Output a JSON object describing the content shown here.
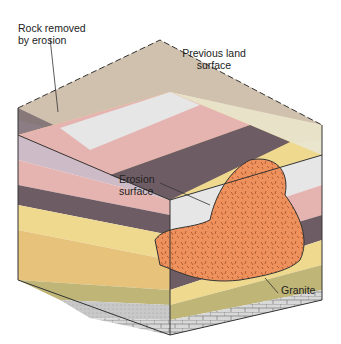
{
  "diagram": {
    "labels": {
      "rock_removed": [
        "Rock removed",
        "by erosion"
      ],
      "previous_surface": [
        "Previous land",
        "surface"
      ],
      "erosion_surface": [
        "Erosion",
        "surface"
      ],
      "granite": "Granite"
    },
    "colors": {
      "removed_light": "#e8e2c8",
      "removed_mauve": "#b8a8a8",
      "removed_tan": "#c9b8a8",
      "white_layer": "#e6e6e6",
      "pink_layer": "#e5b4b0",
      "dark_purple": "#6e5c64",
      "lilac": "#cdbcc8",
      "conglomerate": "#efd98f",
      "sandstone": "#e6c27a",
      "olive_shale": "#bfb577",
      "grey_sand": "#c8c8c8",
      "limestone": "#d8d8d8",
      "granite": "#ee915c",
      "outline": "#333333"
    }
  }
}
